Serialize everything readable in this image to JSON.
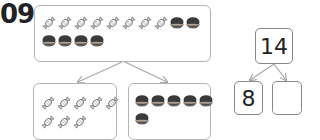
{
  "question_number": "09",
  "whole_picture": {
    "candies": 8,
    "cookies": 6,
    "row1": [
      "candy",
      "candy",
      "candy",
      "candy",
      "candy",
      "candy",
      "candy",
      "candy",
      "cookie",
      "cookie"
    ],
    "row2": [
      "cookie",
      "cookie",
      "cookie",
      "cookie"
    ]
  },
  "part_left": {
    "candies": 8,
    "row1": [
      "candy",
      "candy",
      "candy",
      "candy",
      "candy"
    ],
    "row2": [
      "candy",
      "candy",
      "candy"
    ]
  },
  "part_right": {
    "cookies": 6,
    "row1": [
      "cookie",
      "cookie",
      "cookie",
      "cookie",
      "cookie"
    ],
    "row2": [
      "cookie"
    ]
  },
  "number_bond": {
    "whole": "14",
    "part1": "8",
    "part2": ""
  },
  "colors": {
    "box_border": "#b5b5b5",
    "arrow": "#a8a8a8",
    "cookie": "#3a3a3a",
    "text": "#222222"
  },
  "icons": {
    "candy": "wrapped-candy-icon",
    "cookie": "cookie-icon"
  }
}
